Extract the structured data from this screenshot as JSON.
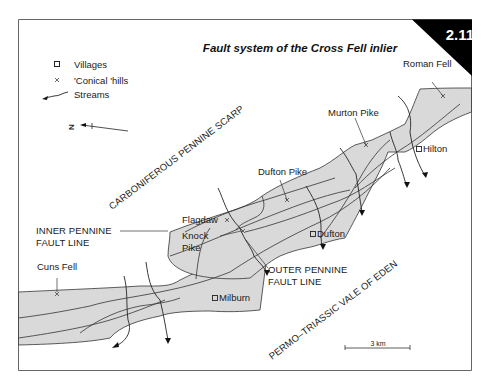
{
  "figure": {
    "number": "2.11",
    "title": "Fault system of the Cross Fell inlier"
  },
  "legend": {
    "items": [
      {
        "symbol": "square",
        "label": "Villages"
      },
      {
        "symbol": "cross",
        "label": "'Conical 'hills"
      },
      {
        "symbol": "arrow-line",
        "label": "Streams"
      }
    ]
  },
  "north_arrow": {
    "label": "N"
  },
  "regions": {
    "scarp": "CARBONIFEROUS PENNINE SCARP",
    "vale": "PERMO–TRIASSIC VALE OF EDEN"
  },
  "fault_lines": {
    "inner_line1": "INNER PENNINE",
    "inner_line2": "FAULT LINE",
    "outer_line1": "OUTER PENNINE",
    "outer_line2": "FAULT LINE"
  },
  "hills": {
    "roman_fell": "Roman Fell",
    "murton_pike": "Murton Pike",
    "dufton_pike": "Dufton Pike",
    "flagdaw": "Flagdaw",
    "knock_pike_1": "Knock",
    "knock_pike_2": "Pike",
    "cuns_fell": "Cuns Fell"
  },
  "villages": {
    "hilton": "Hilton",
    "dufton": "Dufton",
    "milburn": "Milburn"
  },
  "scale_bar": {
    "label": "3 km"
  },
  "colors": {
    "inlier_fill": "#d9d9d9",
    "line": "#2a2a2a",
    "badge_bg": "#000000",
    "frame": "#555555"
  }
}
